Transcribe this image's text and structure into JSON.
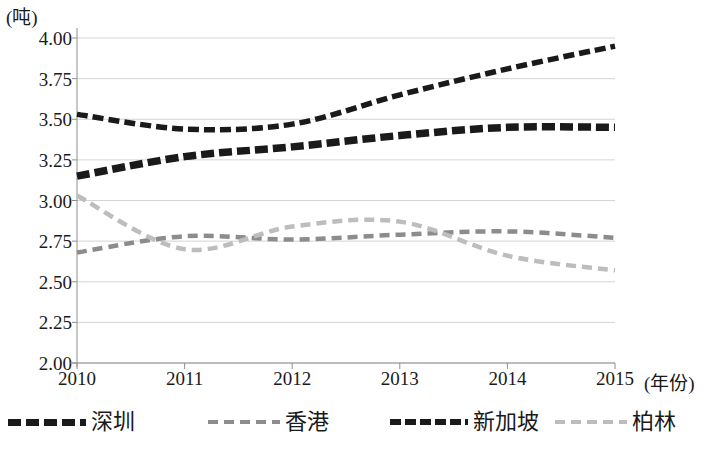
{
  "chart_data": {
    "type": "line",
    "title": "",
    "xlabel": "(年份)",
    "ylabel": "(吨)",
    "x": [
      2010,
      2011,
      2012,
      2013,
      2014,
      2015
    ],
    "xtick_labels": [
      "2010",
      "2011",
      "2012",
      "2013",
      "2014",
      "2015"
    ],
    "ytick_labels": [
      "4.00",
      "3.75",
      "3.50",
      "3.25",
      "3.00",
      "2.75",
      "2.50",
      "2.25",
      "2.00"
    ],
    "ylim": [
      2.0,
      4.0
    ],
    "ytick_step": 0.25,
    "grid": true,
    "legend_position": "bottom",
    "series": [
      {
        "name": "深圳",
        "color": "#1a1a1a",
        "style": "thick-dashed",
        "values": [
          3.15,
          3.27,
          3.33,
          3.4,
          3.45,
          3.45
        ]
      },
      {
        "name": "香港",
        "color": "#8c8c8c",
        "style": "dashed",
        "values": [
          2.68,
          2.78,
          2.76,
          2.79,
          2.81,
          2.77
        ]
      },
      {
        "name": "新加坡",
        "color": "#1a1a1a",
        "style": "dashed",
        "values": [
          3.53,
          3.44,
          3.47,
          3.65,
          3.81,
          3.95
        ]
      },
      {
        "name": "柏林",
        "color": "#bdbdbd",
        "style": "dashed",
        "values": [
          3.03,
          2.7,
          2.84,
          2.87,
          2.66,
          2.57
        ]
      }
    ]
  },
  "axes": {
    "unit_label": "(吨)",
    "xaxis_title": "(年份)"
  },
  "legend": {
    "items": [
      {
        "label": "深圳"
      },
      {
        "label": "香港"
      },
      {
        "label": "新加坡"
      },
      {
        "label": "柏林"
      }
    ]
  }
}
